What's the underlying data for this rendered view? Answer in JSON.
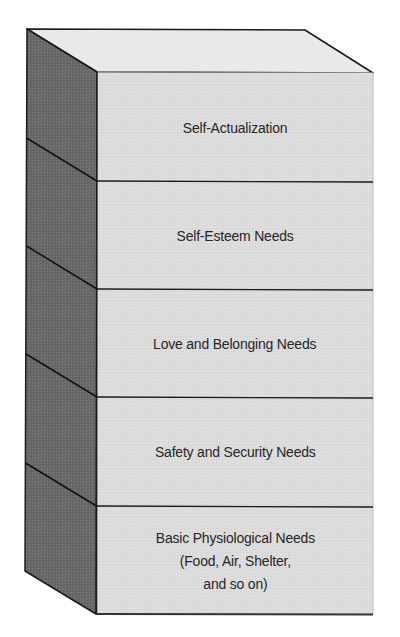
{
  "diagram": {
    "type": "stacked-3d-block",
    "colors": {
      "top_face": "#e9e9e9",
      "front_face": "#dcdcdc",
      "side_face": "#6b6b6b",
      "stroke": "#1a1a1a",
      "text": "#262626",
      "background": "#ffffff"
    },
    "layers": [
      {
        "id": "self-actualization",
        "label": "Self-Actualization"
      },
      {
        "id": "self-esteem",
        "label": "Self-Esteem Needs"
      },
      {
        "id": "love-belonging",
        "label": "Love and Belonging Needs"
      },
      {
        "id": "safety-security",
        "label": "Safety and Security Needs"
      },
      {
        "id": "physiological",
        "label": "Basic Physiological Needs\n(Food, Air, Shelter,\nand so on)"
      }
    ]
  }
}
